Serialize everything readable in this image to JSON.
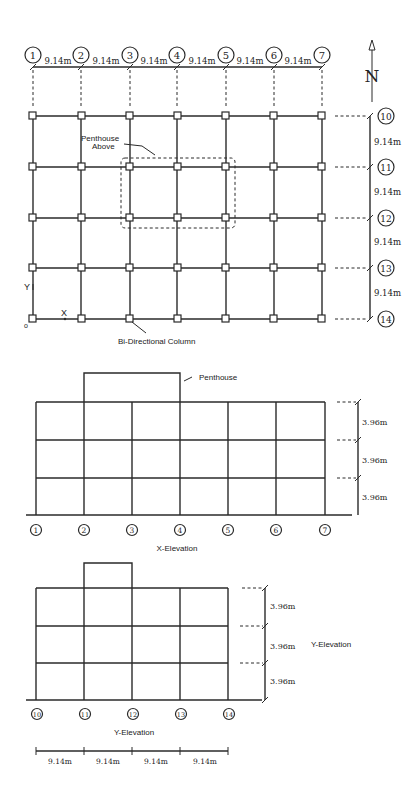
{
  "plan": {
    "column_lines": [
      "1",
      "2",
      "3",
      "4",
      "5",
      "6",
      "7"
    ],
    "column_spacing_labels": [
      "9.14m",
      "9.14m",
      "9.14m",
      "9.14m",
      "9.14m",
      "9.14m"
    ],
    "row_lines": [
      "10",
      "11",
      "12",
      "13",
      "14"
    ],
    "row_spacing_labels": [
      "9.14m",
      "9.14m",
      "9.14m",
      "9.14m"
    ],
    "north_label": "N",
    "penthouse_note": [
      "Penthouse",
      "Above"
    ],
    "column_note": "Bi-Directional Column",
    "axis_y_label": "Y",
    "axis_x_label": "X",
    "origin_label": "o"
  },
  "x_elevation": {
    "title": "X-Elevation",
    "grid_labels": [
      "1",
      "2",
      "3",
      "4",
      "5",
      "6",
      "7"
    ],
    "story_heights": [
      "3.96m",
      "3.96m",
      "3.96m"
    ],
    "penthouse_label": "Penthouse"
  },
  "y_elevation": {
    "title": "Y-Elevation",
    "side_title": "Y-Elevation",
    "grid_labels": [
      "10",
      "11",
      "12",
      "13",
      "14"
    ],
    "story_heights": [
      "3.96m",
      "3.96m",
      "3.96m"
    ],
    "bay_widths": [
      "9.14m",
      "9.14m",
      "9.14m",
      "9.14m"
    ]
  },
  "colors": {
    "line": "#2a2a2a",
    "background": "#ffffff"
  }
}
